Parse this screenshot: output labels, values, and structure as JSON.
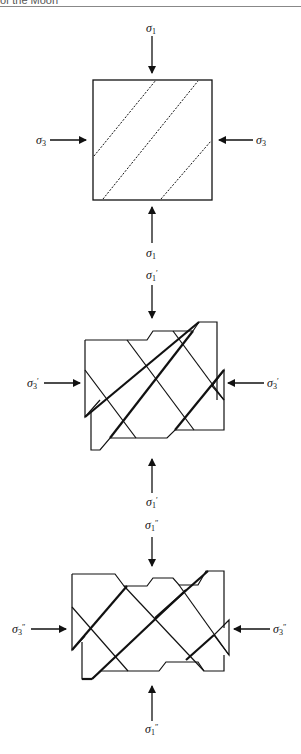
{
  "header": {
    "text": "of the Moon"
  },
  "figure": {
    "panels": [
      {
        "id": "initial",
        "labels": {
          "top": {
            "symbol": "σ",
            "sub": "1",
            "prime": ""
          },
          "bottom": {
            "symbol": "σ",
            "sub": "1",
            "prime": ""
          },
          "left": {
            "symbol": "σ",
            "sub": "3",
            "prime": ""
          },
          "right": {
            "symbol": "σ",
            "sub": "3",
            "prime": ""
          }
        },
        "description": "Square block with three dashed diagonal fractures"
      },
      {
        "id": "first-deformation",
        "labels": {
          "top": {
            "symbol": "σ",
            "sub": "1",
            "prime": "′"
          },
          "bottom": {
            "symbol": "σ",
            "sub": "1",
            "prime": "′"
          },
          "left": {
            "symbol": "σ",
            "sub": "3",
            "prime": "′"
          },
          "right": {
            "symbol": "σ",
            "sub": "3",
            "prime": "′"
          }
        },
        "description": "Block offset along conjugate faults"
      },
      {
        "id": "second-deformation",
        "labels": {
          "top": {
            "symbol": "σ",
            "sub": "1",
            "prime": "″"
          },
          "bottom": {
            "symbol": "σ",
            "sub": "1",
            "prime": "″"
          },
          "left": {
            "symbol": "σ",
            "sub": "3",
            "prime": "″"
          },
          "right": {
            "symbol": "σ",
            "sub": "3",
            "prime": "″"
          }
        },
        "description": "Block further offset along conjugate faults"
      }
    ]
  }
}
